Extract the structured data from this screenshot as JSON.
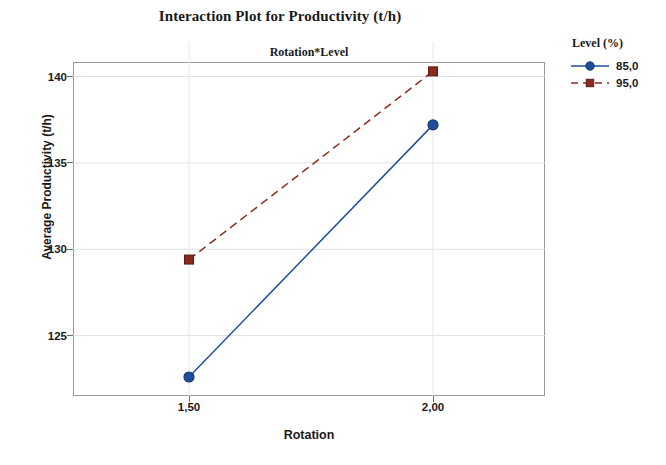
{
  "chart_data": {
    "type": "line",
    "title": "Interaction Plot for Productivity (t/h)",
    "panel_header": "Rotation*Level",
    "xlabel": "Rotation",
    "ylabel": "Average Productivity (t/h)",
    "categories": [
      "1,50",
      "2,00"
    ],
    "x_tick_labels": [
      "1,50",
      "2,00"
    ],
    "y_tick_labels": [
      "125",
      "130",
      "135",
      "140"
    ],
    "y_ticks": [
      125,
      130,
      135,
      140
    ],
    "ylim": [
      121.5,
      142.0
    ],
    "grid": true,
    "legend_position": "right",
    "legend_title": "Level (%)",
    "series": [
      {
        "name": "85,0",
        "values": [
          122.6,
          137.2
        ],
        "color": "#1F4E9C",
        "marker": "circle",
        "linestyle": "solid"
      },
      {
        "name": "95,0",
        "values": [
          129.4,
          140.3
        ],
        "color": "#8B2B1E",
        "marker": "square",
        "linestyle": "dashed"
      }
    ]
  },
  "legend": {
    "title": "Level (%)",
    "entries": [
      {
        "label": "85,0"
      },
      {
        "label": "95,0"
      }
    ]
  },
  "axes": {
    "x_title": "Rotation",
    "y_title": "Average Productivity (t/h)"
  }
}
